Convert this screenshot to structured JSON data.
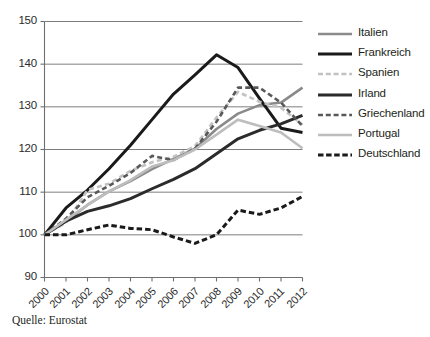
{
  "figure": {
    "title_fragment": "",
    "source_note": "Quelle: Eurostat"
  },
  "legend": {
    "position": "right",
    "entries": [
      {
        "label": "Italien",
        "color": "#8a8a8a",
        "width": 2.6,
        "dash": "none"
      },
      {
        "label": "Frankreich",
        "color": "#1a1a1a",
        "width": 3.0,
        "dash": "none"
      },
      {
        "label": "Spanien",
        "color": "#c2c2c2",
        "width": 2.6,
        "dash": "dashed"
      },
      {
        "label": "Irland",
        "color": "#2b2b2b",
        "width": 3.0,
        "dash": "none"
      },
      {
        "label": "Griechenland",
        "color": "#595959",
        "width": 2.6,
        "dash": "dashed"
      },
      {
        "label": "Portugal",
        "color": "#bdbdbd",
        "width": 2.6,
        "dash": "none"
      },
      {
        "label": "Deutschland",
        "color": "#1a1a1a",
        "width": 3.0,
        "dash": "dashed"
      }
    ]
  },
  "chart_data": {
    "type": "line",
    "title": "",
    "xlabel": "",
    "ylabel": "",
    "x": [
      2000,
      2001,
      2002,
      2003,
      2004,
      2005,
      2006,
      2007,
      2008,
      2009,
      2010,
      2011,
      2012
    ],
    "xticklabels": [
      "2000",
      "2001",
      "2002",
      "2003",
      "2004",
      "2005",
      "2006",
      "2007",
      "2008",
      "2009",
      "2010",
      "2011",
      "2012"
    ],
    "yticks": [
      90,
      100,
      110,
      120,
      130,
      140,
      150
    ],
    "yticklabels": [
      "90",
      "100",
      "110",
      "120",
      "130",
      "140",
      "150"
    ],
    "ylim": [
      90,
      150
    ],
    "xlim": [
      2000,
      2012
    ],
    "grid": "horizontal",
    "series": [
      {
        "name": "Italien",
        "color": "#8a8a8a",
        "dash": "none",
        "width": 2.6,
        "values": [
          100.0,
          103.2,
          107.0,
          110.2,
          112.6,
          115.4,
          117.8,
          120.2,
          124.8,
          128.4,
          130.4,
          131.0,
          134.5
        ]
      },
      {
        "name": "Frankreich",
        "color": "#1a1a1a",
        "dash": "none",
        "width": 3.0,
        "values": [
          100.0,
          106.3,
          110.5,
          115.5,
          121.0,
          127.0,
          133.0,
          137.5,
          142.2,
          139.2,
          132.0,
          125.0,
          124.0
        ]
      },
      {
        "name": "Spanien",
        "color": "#c2c2c2",
        "dash": "dashed",
        "width": 2.6,
        "values": [
          100.0,
          102.8,
          110.5,
          112.0,
          115.0,
          117.0,
          118.3,
          120.8,
          127.5,
          133.5,
          131.2,
          129.8,
          125.8
        ]
      },
      {
        "name": "Irland",
        "color": "#2b2b2b",
        "dash": "none",
        "width": 3.0,
        "values": [
          100.0,
          103.2,
          105.5,
          106.8,
          108.5,
          110.8,
          113.0,
          115.5,
          119.0,
          122.5,
          124.5,
          126.0,
          128.0
        ]
      },
      {
        "name": "Griechenland",
        "color": "#595959",
        "dash": "dashed",
        "width": 2.6,
        "values": [
          100.0,
          103.8,
          108.8,
          111.5,
          114.5,
          118.5,
          117.5,
          120.2,
          126.5,
          134.5,
          134.5,
          131.0,
          125.5
        ]
      },
      {
        "name": "Portugal",
        "color": "#bdbdbd",
        "dash": "none",
        "width": 2.6,
        "values": [
          100.0,
          103.5,
          107.0,
          110.2,
          112.8,
          116.0,
          117.5,
          120.0,
          123.5,
          127.0,
          125.5,
          124.0,
          120.3
        ]
      },
      {
        "name": "Deutschland",
        "color": "#1a1a1a",
        "dash": "dashed",
        "width": 3.0,
        "values": [
          100.0,
          100.0,
          101.2,
          102.3,
          101.5,
          101.2,
          99.5,
          98.0,
          100.0,
          105.8,
          104.8,
          106.3,
          109.0
        ]
      }
    ]
  }
}
